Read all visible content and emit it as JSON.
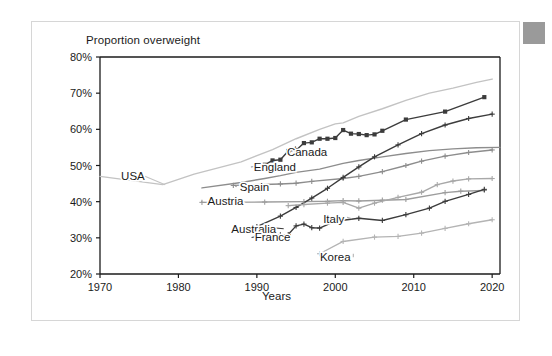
{
  "card": {
    "corner_marker": "gray-square"
  },
  "chart_data": {
    "type": "line",
    "title": "Proportion overweight",
    "xlabel": "Years",
    "ylabel": "",
    "xlim": [
      1970,
      2021
    ],
    "ylim": [
      20,
      80
    ],
    "grid": false,
    "legend_position": "inline-labels",
    "xticks": [
      "1970",
      "1980",
      "1990",
      "2000",
      "2010",
      "2020"
    ],
    "xtick_values": [
      1970,
      1980,
      1990,
      2000,
      2010,
      2020
    ],
    "yticks": [
      "20%",
      "30%",
      "40%",
      "50%",
      "60%",
      "70%",
      "80%"
    ],
    "ytick_values": [
      20,
      30,
      40,
      50,
      60,
      70,
      80
    ],
    "series": [
      {
        "name": "USA",
        "color": "#c3c3c3",
        "marker": "none",
        "label_x": 1974.2,
        "label_y": 47.0,
        "leader_to_x": 1978.3,
        "leader_to_y": 44.7,
        "x": [
          1970,
          1978,
          1982,
          1988,
          1992,
          1995,
          1998,
          2000,
          2001,
          2003,
          2006,
          2009,
          2012,
          2015,
          2018,
          2020
        ],
        "y": [
          47.0,
          44.7,
          47.6,
          51.0,
          54.4,
          57.4,
          60.0,
          61.5,
          61.8,
          63.6,
          65.7,
          68.0,
          70.0,
          71.4,
          73.0,
          73.9
        ]
      },
      {
        "name": "Canada",
        "color": "#3c3c3c",
        "marker": "square",
        "label_x": 1996.4,
        "label_y": 53.6,
        "leader_to_x": 1995.0,
        "leader_to_y": 55.2,
        "x": [
          1991,
          1992,
          1993,
          1994,
          1995,
          1996,
          1997,
          1998,
          1999,
          2000,
          2001,
          2002,
          2003,
          2004,
          2005,
          2006,
          2009,
          2014,
          2019
        ],
        "y": [
          50.2,
          51.4,
          51.6,
          54.0,
          54.2,
          56.2,
          56.4,
          57.4,
          57.4,
          57.6,
          59.8,
          58.8,
          58.7,
          58.4,
          58.6,
          59.6,
          62.7,
          64.9,
          68.9
        ]
      },
      {
        "name": "England",
        "color": "#8d8d8d",
        "marker": "none",
        "label_x": 1992.3,
        "label_y": 49.6,
        "leader_to_x": 1991.0,
        "leader_to_y": 50.1,
        "x": [
          1983,
          1988,
          1991,
          1993,
          1995,
          1998,
          2001,
          2003,
          2006,
          2009,
          2012,
          2015,
          2018,
          2021
        ],
        "y": [
          43.8,
          45.3,
          46.4,
          47.2,
          48.1,
          49.0,
          50.6,
          51.4,
          52.4,
          53.3,
          54.1,
          54.6,
          54.9,
          55.0
        ]
      },
      {
        "name": "Spain",
        "color": "#8d8d8d",
        "marker": "plus",
        "label_x": 1989.7,
        "label_y": 44.1,
        "leader_to_x": 1987.2,
        "leader_to_y": 44.5,
        "x": [
          1987,
          1993,
          1995,
          1997,
          2001,
          2003,
          2006,
          2009,
          2011,
          2014,
          2017,
          2020
        ],
        "y": [
          44.5,
          44.9,
          45.1,
          45.6,
          46.4,
          47.0,
          48.3,
          50.0,
          51.2,
          52.6,
          53.6,
          54.3
        ]
      },
      {
        "name": "Austria",
        "color": "#9d9d9d",
        "marker": "plus",
        "label_x": 1986.0,
        "label_y": 40.2,
        "leader_to_x": 1983.0,
        "leader_to_y": 39.8,
        "x": [
          1983,
          1991,
          1996,
          1999,
          2001,
          2003,
          2006,
          2009,
          2014,
          2016,
          2019
        ],
        "y": [
          39.8,
          39.9,
          40.0,
          40.1,
          40.3,
          40.2,
          40.4,
          40.6,
          42.5,
          42.9,
          43.1
        ]
      },
      {
        "name": "Australia",
        "color": "#3c3c3c",
        "marker": "plus",
        "label_x": 1989.6,
        "label_y": 32.5,
        "leader_to_x": 1990.5,
        "leader_to_y": 33.1,
        "x": [
          1990,
          1993,
          1995,
          1997,
          1999,
          2001,
          2003,
          2005,
          2008,
          2011,
          2014,
          2017,
          2020
        ],
        "y": [
          33.1,
          36.0,
          38.4,
          41.0,
          43.7,
          46.7,
          49.6,
          52.4,
          55.7,
          58.8,
          61.2,
          63.0,
          64.2
        ]
      },
      {
        "name": "France",
        "color": "#3c3c3c",
        "marker": "plus",
        "label_x": 1992.0,
        "label_y": 30.1,
        "leader_to_x": 1990.5,
        "leader_to_y": 30.6,
        "x": [
          1990,
          1991,
          1992,
          1993,
          1994,
          1995,
          1996,
          1997,
          1998,
          2000,
          2003,
          2006,
          2009,
          2012,
          2014,
          2017,
          2019
        ],
        "y": [
          30.6,
          30.6,
          30.7,
          30.8,
          30.9,
          33.3,
          33.8,
          32.8,
          32.7,
          34.6,
          35.4,
          34.8,
          36.4,
          38.2,
          40.1,
          42.0,
          43.4
        ]
      },
      {
        "name": "Italy",
        "color": "#a8a8a8",
        "marker": "plus",
        "label_x": 1999.8,
        "label_y": 35.3,
        "leader_to_x": 2001.5,
        "leader_to_y": 35.7,
        "x": [
          1994,
          1996,
          1999,
          2001,
          2003,
          2005,
          2008,
          2011,
          2013,
          2015,
          2017,
          2020
        ],
        "y": [
          38.9,
          39.2,
          39.6,
          39.8,
          38.2,
          39.6,
          41.2,
          42.6,
          44.7,
          45.7,
          46.3,
          46.4
        ]
      },
      {
        "name": "Korea",
        "color": "#b4b4b4",
        "marker": "plus",
        "label_x": 2000.0,
        "label_y": 24.6,
        "leader_to_x": 2002.3,
        "leader_to_y": 25.6,
        "x": [
          1998,
          2001,
          2005,
          2008,
          2011,
          2014,
          2017,
          2020
        ],
        "y": [
          25.6,
          29.0,
          30.2,
          30.4,
          31.3,
          32.6,
          33.9,
          35.0
        ]
      }
    ]
  }
}
